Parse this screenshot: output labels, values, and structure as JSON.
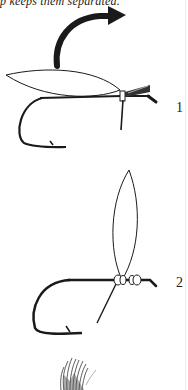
{
  "page": {
    "top_text": "p keeps them separated.",
    "figures": [
      {
        "label": "1",
        "description": "Wing laid along hook shank with arrow showing wing being folded back over; thread wraps at eye"
      },
      {
        "label": "2",
        "description": "Wing standing upright, secured with figure-eight thread wraps behind eye"
      },
      {
        "label": "",
        "description": "Partial hackle/feather sketch at bottom (cut off)"
      }
    ],
    "colors": {
      "ink": "#1a1a1a",
      "paper": "#ffffff"
    }
  }
}
